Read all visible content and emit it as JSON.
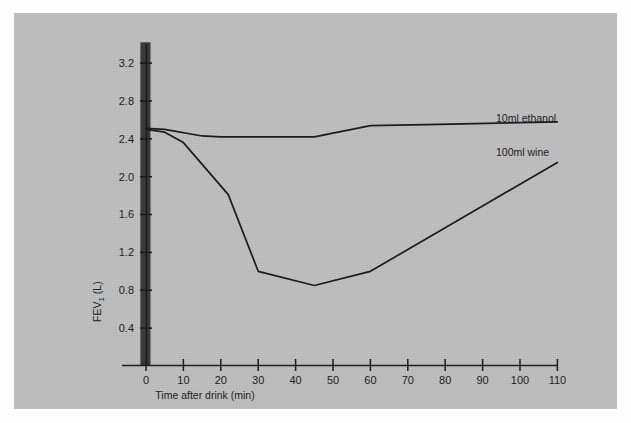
{
  "figure": {
    "background_color": "#bfbfbf",
    "outer_color": "#fdfdfd",
    "axis_color": "#1c1c1c",
    "line_color": "#1c1c1c",
    "marker_bar_color": "#3a3a3a"
  },
  "chart_data": {
    "type": "line",
    "title": "",
    "xlabel": "Time after drink (min)",
    "ylabel": "FEV1 (L)",
    "ylabel_base": "FEV",
    "ylabel_sub": "1",
    "ylabel_unit": " (L)",
    "xlim": [
      -8,
      113
    ],
    "ylim": [
      0,
      3.45
    ],
    "grid": false,
    "legend_position": "inline-right",
    "xticks": [
      0,
      10,
      20,
      30,
      40,
      50,
      60,
      70,
      80,
      90,
      100,
      110
    ],
    "xticklabels": [
      "0",
      "10",
      "20",
      "30",
      "40",
      "50",
      "60",
      "70",
      "80",
      "90",
      "100",
      "110"
    ],
    "yticks": [
      0.4,
      0.8,
      1.2,
      1.6,
      2.0,
      2.4,
      2.8,
      3.2
    ],
    "yticklabels": [
      "0.4",
      "0.8",
      "1.2",
      "1.6",
      "2.0",
      "2.4",
      "2.8",
      "3.2"
    ],
    "annotations": [
      {
        "name": "drink-interval-bar",
        "kind": "vertical-band",
        "x_start": -1.5,
        "x_end": 1.2,
        "y_start": 0.0,
        "y_end": 3.42,
        "color": "#3a3a3a"
      }
    ],
    "series": [
      {
        "name": "10ml ethanol",
        "label": "10ml ethanol",
        "color": "#1c1c1c",
        "x": [
          0,
          5,
          15,
          20,
          45,
          60,
          75,
          110
        ],
        "values": [
          2.51,
          2.5,
          2.43,
          2.42,
          2.42,
          2.54,
          2.55,
          2.58
        ]
      },
      {
        "name": "100ml wine",
        "label": "100ml wine",
        "color": "#1c1c1c",
        "x": [
          0,
          5,
          10,
          22,
          30,
          45,
          60,
          110
        ],
        "values": [
          2.5,
          2.47,
          2.36,
          1.81,
          1.0,
          0.85,
          1.0,
          2.15
        ]
      }
    ]
  },
  "labels": {
    "ethanol_series_label": "10ml ethanol",
    "wine_series_label": "100ml wine",
    "x_axis_title": "Time after drink (min)",
    "y_axis_title_base": "FEV",
    "y_axis_title_sub": "1",
    "y_axis_title_unit": " (L)"
  }
}
